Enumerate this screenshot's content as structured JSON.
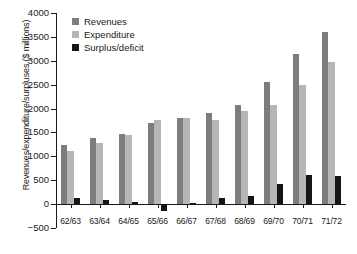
{
  "chart_data": {
    "type": "bar",
    "title": "",
    "xlabel": "",
    "ylabel": "Revenues/expenditure/surpluses ($ millions)",
    "ylim": [
      -500,
      4000
    ],
    "ytick_values": [
      -500,
      0,
      500,
      1000,
      1500,
      2000,
      2500,
      3000,
      3500,
      4000
    ],
    "ytick_labels": [
      "−500",
      "0",
      "500",
      "1000",
      "1500",
      "2000",
      "2500",
      "3000",
      "3500",
      "4000"
    ],
    "grid": false,
    "legend_position": "top-left",
    "categories": [
      "62/63",
      "63/64",
      "64/65",
      "65/66",
      "66/67",
      "67/68",
      "68/69",
      "69/70",
      "70/71",
      "71/72"
    ],
    "series": [
      {
        "name": "Revenues",
        "color": "#7d7d7d",
        "values": [
          1235,
          1380,
          1470,
          1700,
          1810,
          1900,
          2075,
          2550,
          3140,
          3600
        ]
      },
      {
        "name": "Expenditure",
        "color": "#b6b6b6",
        "values": [
          1120,
          1270,
          1440,
          1760,
          1810,
          1760,
          1950,
          2070,
          2490,
          2970
        ]
      },
      {
        "name": "Surplus/deficit",
        "color": "#151515",
        "values": [
          130,
          95,
          45,
          -140,
          20,
          130,
          180,
          420,
          610,
          580
        ]
      }
    ]
  },
  "legend": {
    "items": [
      {
        "label": "Revenues"
      },
      {
        "label": "Expenditure"
      },
      {
        "label": "Surplus/deficit"
      }
    ]
  }
}
